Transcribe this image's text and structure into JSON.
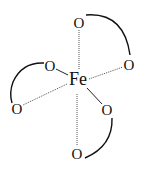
{
  "diagram": {
    "type": "coordination-complex",
    "center_atom": {
      "label": "Fe",
      "x": 78,
      "y": 85
    },
    "oxygen_atoms": [
      {
        "id": "o-top",
        "label": "O",
        "x": 79,
        "y": 28
      },
      {
        "id": "o-right",
        "label": "O",
        "x": 129,
        "y": 70
      },
      {
        "id": "o-left-upper",
        "label": "O",
        "x": 50,
        "y": 71
      },
      {
        "id": "o-left-lower",
        "label": "O",
        "x": 17,
        "y": 114
      },
      {
        "id": "o-right-lower",
        "label": "O",
        "x": 107,
        "y": 115
      },
      {
        "id": "o-bottom",
        "label": "O",
        "x": 77,
        "y": 159
      }
    ],
    "bonds": [
      {
        "from": "Fe",
        "to": "o-top",
        "style": "dashed"
      },
      {
        "from": "Fe",
        "to": "o-right",
        "style": "dashed"
      },
      {
        "from": "Fe",
        "to": "o-left-upper",
        "style": "solid"
      },
      {
        "from": "Fe",
        "to": "o-left-lower",
        "style": "dashed"
      },
      {
        "from": "Fe",
        "to": "o-right-lower",
        "style": "solid"
      },
      {
        "from": "Fe",
        "to": "o-bottom",
        "style": "dashed"
      }
    ],
    "chelate_rings": [
      {
        "between": [
          "o-top",
          "o-right"
        ]
      },
      {
        "between": [
          "o-left-upper",
          "o-left-lower"
        ]
      },
      {
        "between": [
          "o-right-lower",
          "o-bottom"
        ]
      }
    ]
  }
}
